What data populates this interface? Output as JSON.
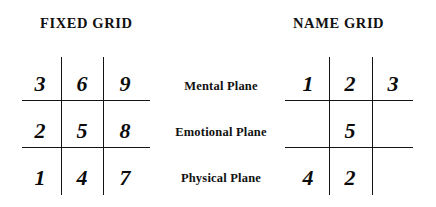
{
  "fixed_grid": {
    "title": "FIXED GRID",
    "rows": [
      {
        "cells": [
          "3",
          "6",
          "9"
        ]
      },
      {
        "cells": [
          "2",
          "5",
          "8"
        ]
      },
      {
        "cells": [
          "1",
          "4",
          "7"
        ]
      }
    ]
  },
  "name_grid": {
    "title": "NAME GRID",
    "rows": [
      {
        "cells": [
          "1",
          "2",
          "3"
        ]
      },
      {
        "cells": [
          "",
          "5",
          ""
        ]
      },
      {
        "cells": [
          "4",
          "2",
          ""
        ]
      }
    ]
  },
  "plane_labels": [
    "Mental Plane",
    "Emotional Plane",
    "Physical Plane"
  ],
  "colors": {
    "background": "#ffffff",
    "ink": "#111111",
    "rule": "#141414"
  }
}
